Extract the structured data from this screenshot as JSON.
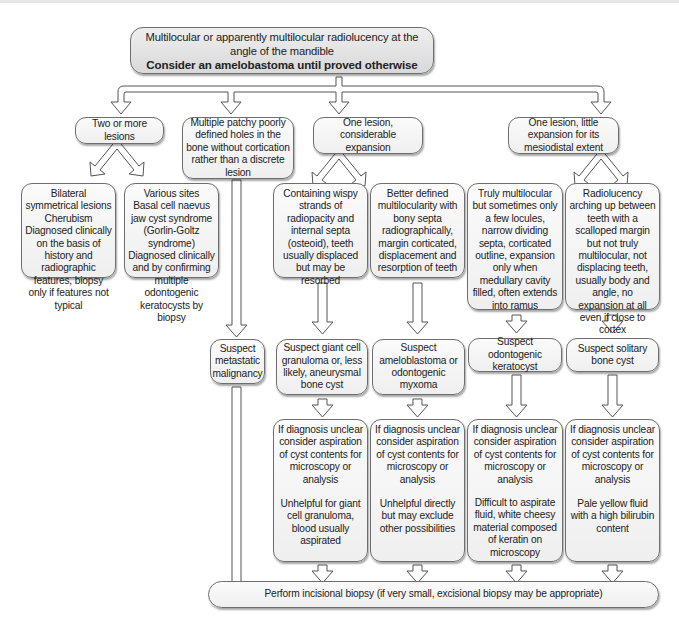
{
  "title": {
    "line1": "Multilocular or apparently multilocular radiolucency at the angle of the mandible",
    "line2": "Consider an amelobastoma until proved otherwise"
  },
  "branches": {
    "two_or_more": "Two or more lesions",
    "patchy": "Multiple patchy poorly defined holes in the bone without cortication rather than a discrete lesion",
    "considerable": "One lesion, considerable expansion",
    "little": "One lesion, little expansion for its mesiodistal extent"
  },
  "bilateral": {
    "heading": "Bilateral symmetrical lesions",
    "diagnosis": "Cherubism",
    "note": "Diagnosed clinically on the basis of history and radiographic features, biopsy only if features not typical"
  },
  "various": {
    "heading": "Various sites",
    "diagnosis": "Basal cell naevus jaw cyst syndrome (Gorlin-Goltz syndrome)",
    "note": "Diagnosed clinically and by confirming multiple odontogenic keratocysts by biopsy"
  },
  "features": {
    "wispy": "Containing wispy strands of radiopacity and internal septa (osteoid), teeth usually displaced but may be resorbed",
    "better": "Better defined multilocularity with bony septa radiographically, margin corticated, displacement and resorption of teeth",
    "truly": "Truly multilocular but sometimes only a few locules, narrow dividing septa, corticated outline, expansion only when medullary cavity filled, often extends into ramus",
    "radiolucency": "Radiolucency arching up between teeth with a scalloped margin but not truly multilocular, not displacing teeth, usually body and angle, no expansion at all even if close to cortex"
  },
  "suspects": {
    "metastatic": "Suspect metastatic malignancy",
    "giant_cell": "Suspect giant cell granuloma or, less likely, aneurysmal bone cyst",
    "ameloblastoma": "Suspect ameloblastoma or odontogenic myxoma",
    "keratocyst": "Suspect odontogenic keratocyst",
    "solitary": "Suspect solitary bone cyst"
  },
  "aspiration": {
    "common": "If diagnosis unclear consider aspiration of cyst contents for microscopy or analysis",
    "giant_cell_result": "Unhelpful for giant cell granuloma, blood usually aspirated",
    "ameloblastoma_result": "Unhelpful directly but may exclude other possibilities",
    "keratocyst_result": "Difficult to aspirate fluid, white cheesy material composed of keratin on microscopy",
    "solitary_result": "Pale yellow fluid with a high bilirubin content"
  },
  "final": "Perform incisional biopsy (if very small, excisional biopsy may be appropriate)"
}
